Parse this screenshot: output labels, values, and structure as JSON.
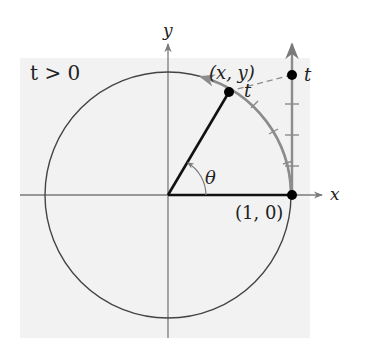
{
  "figure": {
    "condition_label": "t > 0",
    "axis_x_label": "x",
    "axis_y_label": "y",
    "point_label": "(x, y)",
    "arc_length_label": "t",
    "t_line_point_label": "t",
    "start_point_label": "(1, 0)",
    "angle_label": "θ"
  },
  "colors": {
    "panel": "#f2f2f2",
    "axis": "#7a7a7a",
    "circle": "#444444",
    "radius": "#111111",
    "arc_highlight": "#8c8c8c",
    "point": "#000000"
  }
}
